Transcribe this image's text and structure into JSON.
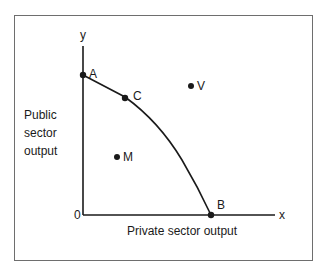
{
  "diagram": {
    "type": "production-possibility-frontier",
    "axes": {
      "y_letter": "y",
      "x_letter": "x",
      "origin": "0",
      "y_label_lines": [
        "Public",
        "sector",
        "output"
      ],
      "x_label": "Private sector output"
    },
    "points": {
      "A": "A",
      "B": "B",
      "C": "C",
      "V": "V",
      "M": "M"
    },
    "colors": {
      "line": "#1a1a1a",
      "frame": "#6e6e6e",
      "background": "#ffffff"
    }
  }
}
